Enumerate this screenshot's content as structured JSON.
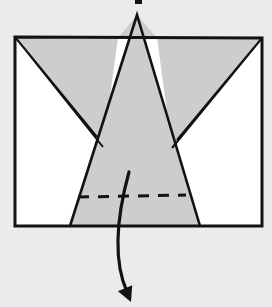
{
  "figure": {
    "title": "Origami fold step diagram",
    "kind": "origami-instruction",
    "caption": "",
    "width": 272,
    "height": 307,
    "background_color": "#ebebeb"
  },
  "colors": {
    "background": "#ebebeb",
    "paper_front": "#ffffff",
    "paper_back": "#cdcdcd",
    "ink": "#121212",
    "arrow": "#121212",
    "crease": "#121212"
  },
  "strokes": {
    "outline_width": 3.0,
    "edge_width": 2.6,
    "thin_edge_width": 2.0,
    "dash_width": 3.0,
    "dash_pattern": "11 9",
    "arrow_width": 3.2
  },
  "paper": {
    "label": "paper-sheet",
    "shape": "rectangle",
    "corners": {
      "top_left": [
        15,
        37
      ],
      "top_right": [
        262,
        38
      ],
      "bottom_right": [
        262,
        226
      ],
      "bottom_left": [
        15,
        226
      ]
    }
  },
  "shapes": {
    "center_point": {
      "label": "center-spike",
      "note": "tall gray triangle rising above the sheet's top edge",
      "apex": [
        137,
        15
      ],
      "base_left": [
        70,
        226
      ],
      "base_right": [
        200,
        226
      ]
    },
    "left_wing": {
      "label": "left-wing-flap",
      "tip": [
        97,
        137
      ],
      "top_outer": [
        15,
        37
      ],
      "top_inner": [
        118,
        38
      ]
    },
    "right_wing": {
      "label": "right-wing-flap",
      "tip": [
        177,
        140
      ],
      "top_outer": [
        262,
        38
      ],
      "top_inner": [
        157,
        38
      ]
    },
    "left_hidden_edge": {
      "label": "left-inner-crease",
      "from": [
        15,
        37
      ],
      "to": [
        103,
        147
      ]
    },
    "right_hidden_edge": {
      "label": "right-inner-crease",
      "from": [
        262,
        38
      ],
      "to": [
        172,
        148
      ]
    }
  },
  "crease": {
    "label": "valley-fold-line",
    "style": "dashed",
    "from": [
      78,
      197
    ],
    "to": [
      186,
      195
    ]
  },
  "arrow": {
    "label": "fold-down-arrow",
    "direction": "down",
    "start": [
      129,
      172
    ],
    "control_1": [
      118,
      212
    ],
    "control_2": [
      112,
      258
    ],
    "end": [
      127,
      292
    ],
    "head_tip": [
      131,
      302
    ],
    "head_size": 15
  },
  "top_mark": {
    "label": "page-artifact-mark",
    "x": 135,
    "y": 0,
    "width": 7,
    "height": 4
  }
}
